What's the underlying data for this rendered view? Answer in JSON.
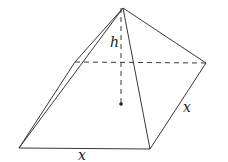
{
  "diagram": {
    "type": "square-pyramid",
    "stroke_color": "#3a3a3a",
    "points": {
      "apex": [
        123,
        8
      ],
      "front_left": [
        19,
        148
      ],
      "front_right": [
        150,
        149
      ],
      "back_right": [
        206,
        63
      ],
      "back_left": [
        75,
        62
      ],
      "center": [
        121,
        104
      ]
    },
    "labels": {
      "height": "h",
      "base_front": "x",
      "base_side": "x"
    }
  }
}
